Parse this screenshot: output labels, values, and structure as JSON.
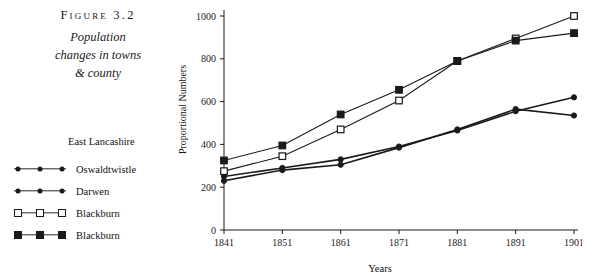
{
  "caption": {
    "figure_number": "Figure 3.2",
    "line1": "Population",
    "line2": "changes in towns",
    "line3": "& county"
  },
  "legend": {
    "title": "East Lancashire",
    "items": [
      {
        "label": "Oswaldtwistle",
        "marker": "dot"
      },
      {
        "label": "Darwen",
        "marker": "dot"
      },
      {
        "label": "Blackburn",
        "marker": "square-open"
      },
      {
        "label": "Blackburn",
        "marker": "square-filled"
      }
    ]
  },
  "chart_data": {
    "type": "line",
    "title": "",
    "xlabel": "Years",
    "ylabel": "Proportional Numbers",
    "categories": [
      "1841",
      "1851",
      "1861",
      "1871",
      "1881",
      "1891",
      "1901"
    ],
    "x": [
      1841,
      1851,
      1861,
      1871,
      1881,
      1891,
      1901
    ],
    "ylim": [
      0,
      1000
    ],
    "yticks": [
      0,
      200,
      400,
      600,
      800,
      1000
    ],
    "grid": false,
    "legend_position": "left-outside",
    "series": [
      {
        "name": "Oswaldtwistle",
        "marker": "dot",
        "values": [
          230,
          280,
          305,
          385,
          470,
          565,
          535
        ]
      },
      {
        "name": "Darwen",
        "marker": "dot",
        "values": [
          250,
          290,
          330,
          390,
          465,
          555,
          620
        ]
      },
      {
        "name": "Blackburn",
        "marker": "square-open",
        "values": [
          275,
          345,
          470,
          605,
          790,
          895,
          1000
        ]
      },
      {
        "name": "Blackburn",
        "marker": "square-filled",
        "values": [
          325,
          395,
          540,
          655,
          790,
          885,
          920
        ]
      }
    ]
  }
}
